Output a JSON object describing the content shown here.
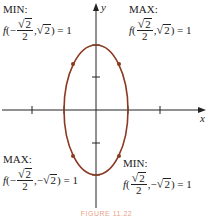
{
  "figure": {
    "caption": "FIGURE 11.22",
    "axes": {
      "x_label": "x",
      "y_label": "y"
    },
    "curve": {
      "type": "ellipse",
      "color": "#8b3a22",
      "center": [
        0,
        0
      ],
      "semi_axis_x": 1,
      "semi_axis_y": 2
    },
    "colors": {
      "axis": "#222222",
      "curve": "#8b3a22",
      "caption": "#e08060"
    },
    "annotations": [
      {
        "id": "top-left",
        "title": "MIN:",
        "func": "f",
        "x_sign": "−",
        "x_num": "√2",
        "x_den": "2",
        "y_sign": "",
        "y_val": "√2",
        "value": "= 1"
      },
      {
        "id": "top-right",
        "title": "MAX:",
        "func": "f",
        "x_sign": "",
        "x_num": "√2",
        "x_den": "2",
        "y_sign": "",
        "y_val": "√2",
        "value": "= 1"
      },
      {
        "id": "bottom-left",
        "title": "MAX:",
        "func": "f",
        "x_sign": "−",
        "x_num": "√2",
        "x_den": "2",
        "y_sign": "−",
        "y_val": "√2",
        "value": "= 1"
      },
      {
        "id": "bottom-right",
        "title": "MIN:",
        "func": "f",
        "x_sign": "",
        "x_num": "√2",
        "x_den": "2",
        "y_sign": "−",
        "y_val": "√2",
        "value": "= 1"
      }
    ],
    "text": {
      "ann0_title": "MIN:",
      "ann1_title": "MAX:",
      "ann2_title": "MAX:",
      "ann3_title": "MIN:",
      "f": "f",
      "open": "(",
      "minus": "−",
      "two": "2",
      "root_arg": "2",
      "radical": "√",
      "comma": ",",
      "close_eq": ") = 1"
    }
  }
}
